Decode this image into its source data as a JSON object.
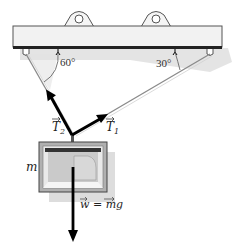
{
  "diagram": {
    "type": "free-body / hanging mass",
    "angles": {
      "left": "60°",
      "right": "30°"
    },
    "labels": {
      "t2_letter": "T",
      "t2_sub": "2",
      "t1_letter": "T",
      "t1_sub": "1",
      "mass": "m",
      "weight": "w = mg"
    },
    "colors": {
      "beam_fill": "#f2f2f2",
      "beam_stroke": "#555555",
      "shadow": "#c8c8c8",
      "vector": "#000000",
      "rope": "#8a8a8a",
      "box_outer": "#9a9a9a",
      "box_inner": "#cfcfcf"
    }
  }
}
